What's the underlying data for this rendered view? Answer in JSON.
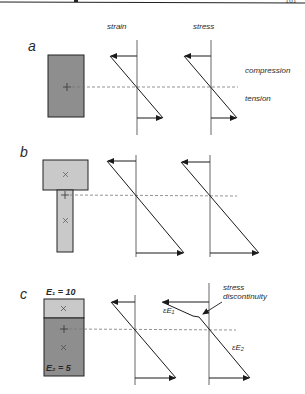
{
  "header": {
    "page_number": "161"
  },
  "column_labels": {
    "strain": "strain",
    "stress": "stress"
  },
  "side_labels": {
    "compression": "compression",
    "tension": "tension"
  },
  "panels": [
    {
      "id": "a",
      "label": "a",
      "section": "rectangular"
    },
    {
      "id": "b",
      "label": "b",
      "section": "T-section"
    },
    {
      "id": "c",
      "label": "c",
      "section": "composite",
      "top_modulus": "E₁ = 10",
      "bottom_modulus": "E₂ = 5",
      "annotations": {
        "stress_discontinuity": "stress\ndiscontinuity",
        "top_stress": "εE₁",
        "bottom_stress": "εE₂"
      }
    }
  ],
  "colors": {
    "dark_fill": "#8e8e8e",
    "light_fill": "#c9c9c9",
    "line": "#1a1a1a",
    "dash": "#777777"
  }
}
